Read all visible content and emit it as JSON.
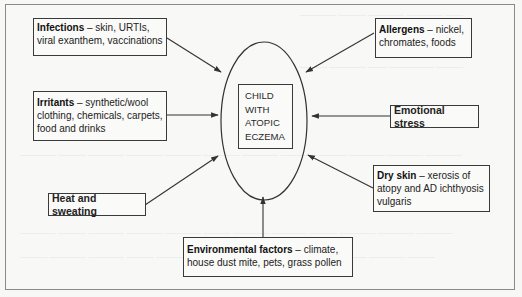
{
  "diagram": {
    "center": {
      "lines": [
        "CHILD",
        "WITH",
        "ATOPIC",
        "ECZEMA"
      ]
    },
    "factors": [
      {
        "id": "infections",
        "heading": "Infections",
        "separator": " – ",
        "detail": "skin, URTIs, viral exanthem, vaccinations"
      },
      {
        "id": "allergens",
        "heading": "Allergens",
        "separator": " – ",
        "detail": "nickel, chromates, foods"
      },
      {
        "id": "irritants",
        "heading": "Irritants",
        "separator": " – ",
        "detail": "synthetic/wool clothing, chemicals, carpets, food and drinks"
      },
      {
        "id": "emotional-stress",
        "heading": "Emotional stress",
        "separator": "",
        "detail": ""
      },
      {
        "id": "heat-sweating",
        "heading": "Heat and sweating",
        "separator": "",
        "detail": ""
      },
      {
        "id": "dry-skin",
        "heading": "Dry skin",
        "separator": " – ",
        "detail": "xerosis of atopy and AD ichthyosis vulgaris"
      },
      {
        "id": "environmental",
        "heading": "Environmental factors",
        "separator": " – ",
        "detail": "climate, house dust mite, pets, grass pollen"
      }
    ],
    "colors": {
      "line": "#3a3a3a",
      "frame": "#8a8a8a",
      "background": "#f8f8f6"
    }
  }
}
